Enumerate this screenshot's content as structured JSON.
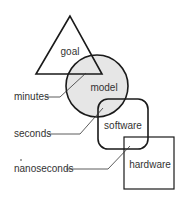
{
  "diagram": {
    "shapes": [
      {
        "id": "goal",
        "label": "goal",
        "shape": "triangle"
      },
      {
        "id": "model",
        "label": "model",
        "shape": "circle",
        "fill": "#e6e6e6"
      },
      {
        "id": "software",
        "label": "software",
        "shape": "rounded-square"
      },
      {
        "id": "hardware",
        "label": "hardware",
        "shape": "square"
      }
    ],
    "callouts": [
      {
        "label": "minutes",
        "points_to": "goal-model overlap"
      },
      {
        "label": "seconds",
        "points_to": "model-software overlap"
      },
      {
        "label": "nanoseconds",
        "points_to": "software-hardware overlap"
      }
    ],
    "colors": {
      "stroke": "#1a1a1a",
      "model_fill": "#e6e6e6",
      "text": "#333333"
    }
  }
}
